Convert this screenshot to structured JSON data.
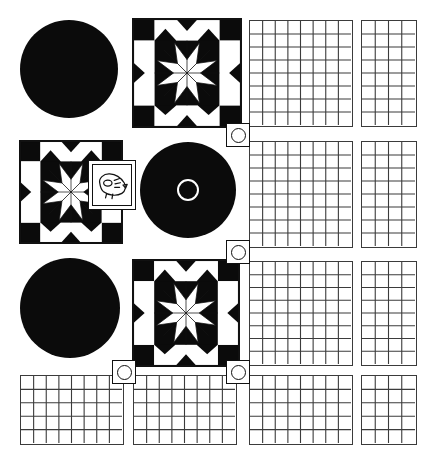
{
  "sheet": {
    "title": "Quilt Pattern Layout Sheet",
    "background_color": "#ffffff",
    "ink_color": "#0b0b0b",
    "grid_line_color": "#3b3b3b",
    "width": 431,
    "height": 465
  },
  "tiles": [
    {
      "id": "disc-top-left",
      "kind": "solid-circle",
      "label": "Solid black circle",
      "x": 20,
      "y": 20,
      "w": 98,
      "h": 98
    },
    {
      "id": "quilt-top",
      "kind": "quilt-block",
      "label": "Eight point star quilt block",
      "x": 133,
      "y": 19,
      "w": 108,
      "h": 108,
      "cells": 5,
      "star_points": 8
    },
    {
      "id": "grid-top-wide",
      "kind": "grid",
      "label": "Graph paper 8 by 8",
      "x": 249,
      "y": 20,
      "w": 104,
      "h": 107,
      "cols": 8,
      "rows": 8
    },
    {
      "id": "grid-top-narrow",
      "kind": "grid",
      "label": "Graph paper 4 by 8",
      "x": 361,
      "y": 20,
      "w": 56,
      "h": 107,
      "cols": 4,
      "rows": 8
    },
    {
      "id": "quilt-mid",
      "kind": "quilt-block",
      "label": "Eight point star quilt block",
      "x": 20,
      "y": 141,
      "w": 102,
      "h": 102,
      "cells": 5,
      "star_points": 8
    },
    {
      "id": "sketch-frame",
      "kind": "framed-sketch",
      "label": "Framed hand sketch",
      "x": 88,
      "y": 160,
      "w": 48,
      "h": 50
    },
    {
      "id": "disc-record",
      "kind": "disc-with-hole",
      "label": "Black disc with centre ring",
      "x": 140,
      "y": 142,
      "w": 96,
      "h": 96
    },
    {
      "id": "grid-mid-wide",
      "kind": "grid",
      "label": "Graph paper 8 by 8",
      "x": 249,
      "y": 141,
      "w": 104,
      "h": 107,
      "cols": 8,
      "rows": 8
    },
    {
      "id": "grid-mid-narrow",
      "kind": "grid",
      "label": "Graph paper 4 by 8",
      "x": 361,
      "y": 141,
      "w": 56,
      "h": 107,
      "cols": 4,
      "rows": 8
    },
    {
      "id": "disc-bottom-left",
      "kind": "solid-circle",
      "label": "Solid black circle",
      "x": 20,
      "y": 258,
      "w": 100,
      "h": 100
    },
    {
      "id": "quilt-bottom",
      "kind": "quilt-block",
      "label": "Eight point star quilt block",
      "x": 133,
      "y": 260,
      "w": 106,
      "h": 106,
      "cells": 5,
      "star_points": 8
    },
    {
      "id": "grid-row3-wide",
      "kind": "grid",
      "label": "Graph paper 8 by 8",
      "x": 249,
      "y": 261,
      "w": 104,
      "h": 105,
      "cols": 8,
      "rows": 8
    },
    {
      "id": "grid-row3-narrow",
      "kind": "grid",
      "label": "Graph paper 4 by 8",
      "x": 361,
      "y": 261,
      "w": 56,
      "h": 105,
      "cols": 4,
      "rows": 8
    },
    {
      "id": "grid-row4-left",
      "kind": "grid",
      "label": "Graph paper 8 by 5",
      "x": 20,
      "y": 375,
      "w": 104,
      "h": 70,
      "cols": 8,
      "rows": 5
    },
    {
      "id": "grid-row4-mid",
      "kind": "grid",
      "label": "Graph paper 8 by 5",
      "x": 133,
      "y": 375,
      "w": 104,
      "h": 70,
      "cols": 8,
      "rows": 5
    },
    {
      "id": "grid-row4-wide",
      "kind": "grid",
      "label": "Graph paper 8 by 5",
      "x": 249,
      "y": 375,
      "w": 104,
      "h": 70,
      "cols": 8,
      "rows": 5
    },
    {
      "id": "grid-row4-narrow",
      "kind": "grid",
      "label": "Graph paper 4 by 5",
      "x": 361,
      "y": 375,
      "w": 56,
      "h": 70,
      "cols": 4,
      "rows": 5
    }
  ],
  "markers": [
    {
      "id": "marker-1",
      "label": "ring marker",
      "x": 226,
      "y": 123,
      "size": 24
    },
    {
      "id": "marker-2",
      "label": "ring marker",
      "x": 226,
      "y": 240,
      "size": 24
    },
    {
      "id": "marker-3",
      "label": "ring marker",
      "x": 226,
      "y": 360,
      "size": 24
    },
    {
      "id": "marker-4",
      "label": "ring marker",
      "x": 112,
      "y": 360,
      "size": 24
    }
  ]
}
